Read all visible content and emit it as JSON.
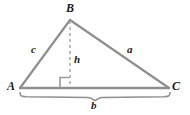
{
  "figure": {
    "type": "geometry-diagram",
    "shape": "triangle",
    "background_color": "#ffffff",
    "stroke_color": "#8a8a8a",
    "label_color": "#1a1a1a"
  },
  "vertices": [
    {
      "id": "A",
      "label": "A",
      "x": 20,
      "y": 88,
      "label_x": 8,
      "label_y": 81
    },
    {
      "id": "B",
      "label": "B",
      "x": 70,
      "y": 20,
      "label_x": 67,
      "label_y": 3
    },
    {
      "id": "C",
      "label": "C",
      "x": 169,
      "y": 88,
      "label_x": 172,
      "label_y": 81
    }
  ],
  "sides": [
    {
      "id": "c",
      "label": "c",
      "from": "A",
      "to": "B",
      "label_x": 31,
      "label_y": 45
    },
    {
      "id": "a",
      "label": "a",
      "from": "B",
      "to": "C",
      "label_x": 127,
      "label_y": 45
    },
    {
      "id": "b",
      "label": "b",
      "from": "A",
      "to": "C",
      "label_x": 91,
      "label_y": 99
    }
  ],
  "altitude": {
    "id": "h",
    "label": "h",
    "style": "dashed",
    "from_x": 70,
    "from_y": 20,
    "to_x": 70,
    "to_y": 88,
    "label_x": 74,
    "label_y": 55
  },
  "right_angle_marker": {
    "name": "right-angle-marker",
    "x": 60,
    "y": 78,
    "size": 10
  },
  "brace": {
    "name": "base-brace",
    "start_x": 20,
    "end_x": 170,
    "y": 93,
    "tip_x": 95,
    "tip_y": 100
  }
}
